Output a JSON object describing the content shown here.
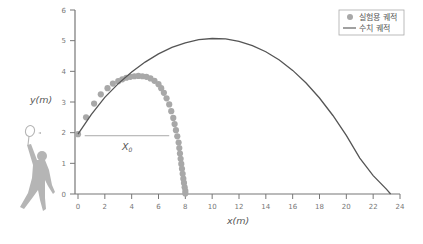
{
  "chart_data": {
    "type": "scatter",
    "title": "",
    "xlabel": "x(m)",
    "ylabel": "y(m)",
    "xlim": [
      0,
      24
    ],
    "ylim": [
      0,
      6
    ],
    "xticks": [
      0,
      2,
      4,
      6,
      8,
      10,
      12,
      14,
      16,
      18,
      20,
      22,
      24
    ],
    "yticks": [
      0,
      1,
      2,
      3,
      4,
      5,
      6
    ],
    "grid": false,
    "legend_position": "top-right",
    "annotation": {
      "label": "X",
      "subscript": "0",
      "y": 1.9,
      "x_from": 0.5,
      "x_to": 6.8
    },
    "series": [
      {
        "name": "실험용 궤적",
        "kind": "markers",
        "color": "#a8a8a8",
        "x": [
          0,
          0.6,
          1.2,
          1.7,
          2.2,
          2.6,
          3.0,
          3.3,
          3.6,
          3.9,
          4.2,
          4.5,
          4.8,
          5.1,
          5.4,
          5.7,
          6.0,
          6.2,
          6.4,
          6.6,
          6.8,
          6.95,
          7.1,
          7.2,
          7.3,
          7.4,
          7.5,
          7.55,
          7.6,
          7.65,
          7.7,
          7.75,
          7.8,
          7.85,
          7.9,
          7.95,
          8.0,
          8.0
        ],
        "y": [
          1.95,
          2.5,
          2.95,
          3.25,
          3.45,
          3.6,
          3.68,
          3.74,
          3.79,
          3.82,
          3.84,
          3.85,
          3.84,
          3.82,
          3.77,
          3.69,
          3.58,
          3.45,
          3.3,
          3.12,
          2.92,
          2.7,
          2.48,
          2.28,
          2.08,
          1.88,
          1.68,
          1.5,
          1.32,
          1.15,
          0.98,
          0.82,
          0.66,
          0.5,
          0.36,
          0.22,
          0.1,
          0.02
        ]
      },
      {
        "name": "수치 궤적",
        "kind": "line",
        "color": "#555555",
        "x": [
          0,
          1,
          2,
          3,
          4,
          5,
          6,
          7,
          8,
          9,
          10,
          11,
          12,
          13,
          14,
          15,
          16,
          17,
          18,
          19,
          20,
          21,
          22,
          23,
          23.3
        ],
        "y": [
          1.95,
          2.6,
          3.15,
          3.6,
          3.98,
          4.3,
          4.57,
          4.78,
          4.93,
          5.03,
          5.07,
          5.06,
          4.98,
          4.84,
          4.64,
          4.37,
          4.03,
          3.62,
          3.13,
          2.56,
          1.91,
          1.17,
          0.6,
          0.15,
          0
        ]
      }
    ]
  },
  "legend": {
    "items": [
      {
        "label": "실험용 궤적",
        "marker": "dot"
      },
      {
        "label": "수치 궤적",
        "marker": "line"
      }
    ]
  },
  "axes": {
    "x_title": "x(m)",
    "y_title": "y(m)",
    "annotation_main": "X",
    "annotation_sub": "0"
  },
  "illustration": {
    "name": "badminton-player",
    "color": "#b5b5b5"
  }
}
